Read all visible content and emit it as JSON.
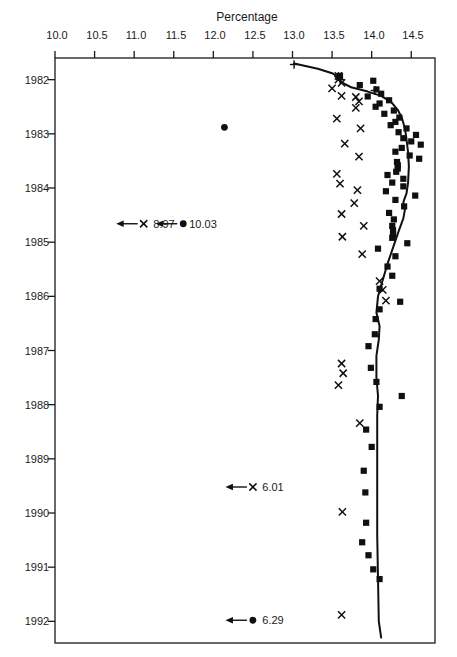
{
  "chart_data": {
    "type": "scatter",
    "title": "",
    "xlabel": "",
    "ylabel": "Percentage",
    "xlim": [
      1981.6,
      1992.4
    ],
    "ylim": [
      10.0,
      14.8
    ],
    "grid": false,
    "legend_position": "none",
    "x_ticks": [
      "1982",
      "1983",
      "1984",
      "1985",
      "1986",
      "1987",
      "1988",
      "1989",
      "1990",
      "1991",
      "1992"
    ],
    "x_tick_values": [
      1982,
      1983,
      1984,
      1985,
      1986,
      1987,
      1988,
      1989,
      1990,
      1991,
      1992
    ],
    "y_ticks": [
      "10.0",
      "10.5",
      "11.0",
      "11.5",
      "12.0",
      "12.5",
      "13.0",
      "13.5",
      "14.0",
      "14.5"
    ],
    "y_tick_values": [
      10.0,
      10.5,
      11.0,
      11.5,
      12.0,
      12.5,
      13.0,
      13.5,
      14.0,
      14.5
    ],
    "series": [
      {
        "name": "squares",
        "marker": "filled-square",
        "points": [
          [
            1981.93,
            13.6
          ],
          [
            1982.02,
            14.02
          ],
          [
            1982.1,
            13.85
          ],
          [
            1982.18,
            14.06
          ],
          [
            1982.26,
            14.12
          ],
          [
            1982.31,
            13.95
          ],
          [
            1982.38,
            14.22
          ],
          [
            1982.44,
            14.1
          ],
          [
            1982.5,
            14.05
          ],
          [
            1982.57,
            14.28
          ],
          [
            1982.63,
            14.16
          ],
          [
            1982.7,
            14.35
          ],
          [
            1982.78,
            14.3
          ],
          [
            1982.84,
            14.24
          ],
          [
            1982.9,
            14.44
          ],
          [
            1982.97,
            14.34
          ],
          [
            1983.02,
            14.56
          ],
          [
            1983.08,
            14.4
          ],
          [
            1983.14,
            14.5
          ],
          [
            1983.2,
            14.62
          ],
          [
            1983.26,
            14.38
          ],
          [
            1983.33,
            14.3
          ],
          [
            1983.4,
            14.48
          ],
          [
            1983.46,
            14.6
          ],
          [
            1983.52,
            14.32
          ],
          [
            1983.58,
            14.33
          ],
          [
            1983.64,
            14.33
          ],
          [
            1983.7,
            14.31
          ],
          [
            1983.76,
            14.2
          ],
          [
            1983.83,
            14.4
          ],
          [
            1983.9,
            14.26
          ],
          [
            1983.97,
            14.4
          ],
          [
            1984.06,
            14.18
          ],
          [
            1984.14,
            14.55
          ],
          [
            1984.22,
            14.3
          ],
          [
            1984.34,
            14.41
          ],
          [
            1984.46,
            14.22
          ],
          [
            1984.58,
            14.28
          ],
          [
            1984.7,
            14.26
          ],
          [
            1984.78,
            14.27
          ],
          [
            1984.86,
            14.27
          ],
          [
            1984.92,
            14.26
          ],
          [
            1985.02,
            14.45
          ],
          [
            1985.12,
            14.08
          ],
          [
            1985.26,
            14.3
          ],
          [
            1985.45,
            14.2
          ],
          [
            1985.62,
            14.26
          ],
          [
            1985.86,
            14.1
          ],
          [
            1986.1,
            14.36
          ],
          [
            1986.24,
            14.1
          ],
          [
            1986.42,
            14.05
          ],
          [
            1986.7,
            14.04
          ],
          [
            1986.92,
            13.96
          ],
          [
            1987.32,
            13.99
          ],
          [
            1987.58,
            14.06
          ],
          [
            1987.84,
            14.38
          ],
          [
            1988.04,
            14.1
          ],
          [
            1988.46,
            13.93
          ],
          [
            1988.78,
            14.0
          ],
          [
            1989.22,
            13.9
          ],
          [
            1989.62,
            13.92
          ],
          [
            1990.18,
            13.93
          ],
          [
            1990.54,
            13.88
          ],
          [
            1990.78,
            13.96
          ],
          [
            1991.04,
            14.02
          ],
          [
            1991.22,
            14.1
          ]
        ]
      },
      {
        "name": "crosses",
        "marker": "x-cross",
        "points": [
          [
            1981.93,
            13.58
          ],
          [
            1982.0,
            13.58
          ],
          [
            1982.06,
            13.62
          ],
          [
            1982.16,
            13.5
          ],
          [
            1982.3,
            13.62
          ],
          [
            1982.32,
            13.8
          ],
          [
            1982.4,
            13.84
          ],
          [
            1982.52,
            13.8
          ],
          [
            1982.72,
            13.56
          ],
          [
            1982.9,
            13.86
          ],
          [
            1983.18,
            13.66
          ],
          [
            1983.42,
            13.84
          ],
          [
            1983.74,
            13.56
          ],
          [
            1983.92,
            13.6
          ],
          [
            1984.04,
            13.82
          ],
          [
            1984.28,
            13.78
          ],
          [
            1984.48,
            13.62
          ],
          [
            1984.7,
            13.9
          ],
          [
            1984.9,
            13.63
          ],
          [
            1985.22,
            13.88
          ],
          [
            1985.72,
            14.1
          ],
          [
            1985.88,
            14.14
          ],
          [
            1986.08,
            14.18
          ],
          [
            1987.24,
            13.62
          ],
          [
            1987.42,
            13.64
          ],
          [
            1987.64,
            13.58
          ],
          [
            1988.34,
            13.85
          ],
          [
            1989.98,
            13.63
          ],
          [
            1991.88,
            13.62
          ]
        ]
      },
      {
        "name": "plus-markers",
        "marker": "plus",
        "points": [
          [
            1981.72,
            13.02
          ],
          [
            1981.94,
            13.58
          ],
          [
            1982.0,
            13.6
          ],
          [
            1982.2,
            14.04
          ]
        ]
      },
      {
        "name": "isolated-circle",
        "marker": "filled-circle",
        "points": [
          [
            1982.88,
            12.14
          ]
        ]
      }
    ],
    "fitted_curve": {
      "name": "fitted-trend-line",
      "points": [
        [
          1981.7,
          13.02
        ],
        [
          1981.8,
          13.32
        ],
        [
          1981.88,
          13.5
        ],
        [
          1981.95,
          13.58
        ],
        [
          1982.05,
          13.62
        ],
        [
          1982.14,
          13.74
        ],
        [
          1982.22,
          13.95
        ],
        [
          1982.3,
          14.12
        ],
        [
          1982.42,
          14.25
        ],
        [
          1982.56,
          14.33
        ],
        [
          1982.7,
          14.38
        ],
        [
          1982.9,
          14.42
        ],
        [
          1983.1,
          14.44
        ],
        [
          1983.34,
          14.46
        ],
        [
          1983.6,
          14.47
        ],
        [
          1983.9,
          14.46
        ],
        [
          1984.1,
          14.44
        ],
        [
          1984.26,
          14.4
        ],
        [
          1984.4,
          14.42
        ],
        [
          1984.56,
          14.4
        ],
        [
          1984.8,
          14.34
        ],
        [
          1985.1,
          14.27
        ],
        [
          1985.4,
          14.2
        ],
        [
          1985.7,
          14.14
        ],
        [
          1986.0,
          14.08
        ],
        [
          1986.3,
          14.06
        ],
        [
          1986.55,
          14.1
        ],
        [
          1986.8,
          14.09
        ],
        [
          1987.1,
          14.06
        ],
        [
          1987.5,
          14.06
        ],
        [
          1987.84,
          14.08
        ],
        [
          1988.2,
          14.07
        ],
        [
          1988.8,
          14.07
        ],
        [
          1989.6,
          14.07
        ],
        [
          1990.4,
          14.07
        ],
        [
          1991.2,
          14.08
        ],
        [
          1992.0,
          14.09
        ],
        [
          1992.3,
          14.12
        ]
      ]
    },
    "annotations": [
      {
        "label": "6.29",
        "marker": "filled-circle",
        "x": 1991.98,
        "y": 12.5,
        "arrow": "down-off-scale"
      },
      {
        "label": "6.01",
        "marker": "x-cross",
        "x": 1989.52,
        "y": 12.5,
        "arrow": "down-off-scale"
      },
      {
        "label": "10.03",
        "marker": "filled-circle",
        "x": 1984.66,
        "y": 11.62,
        "arrow": "down-off-scale"
      },
      {
        "label": "8.97",
        "marker": "x-cross",
        "x": 1984.66,
        "y": 11.12,
        "arrow": "down-off-scale"
      }
    ]
  },
  "figure": {
    "axis_color": "#1a1a1a",
    "marker_color": "#101010",
    "curve_color": "#101010",
    "background": "#ffffff",
    "y_axis_title": "Percentage"
  }
}
